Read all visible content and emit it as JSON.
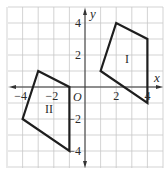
{
  "chart_data": {
    "type": "diagram",
    "title": "",
    "xlabel": "x",
    "ylabel": "y",
    "origin_label": "O",
    "xlim": [
      -5,
      5
    ],
    "ylim": [
      -5,
      5
    ],
    "grid": true,
    "x_ticks": [
      {
        "value": -4,
        "label": "−4"
      },
      {
        "value": -2,
        "label": "−2"
      },
      {
        "value": 2,
        "label": "2"
      },
      {
        "value": 4,
        "label": "4"
      }
    ],
    "y_ticks": [
      {
        "value": 4,
        "label": "4"
      },
      {
        "value": 2,
        "label": "2"
      },
      {
        "value": -2,
        "label": "−2"
      },
      {
        "value": -4,
        "label": "−4"
      }
    ],
    "shapes": [
      {
        "name": "I",
        "label": "I",
        "vertices": [
          [
            1,
            1
          ],
          [
            2,
            4
          ],
          [
            4,
            3
          ],
          [
            4,
            -1
          ]
        ],
        "label_pos": [
          2.7,
          1.5
        ]
      },
      {
        "name": "II",
        "label": "II",
        "vertices": [
          [
            -3,
            1
          ],
          [
            -1,
            0
          ],
          [
            -1,
            -4
          ],
          [
            -4,
            -2
          ]
        ],
        "label_pos": [
          -2.3,
          -1.6
        ]
      }
    ]
  },
  "colors": {
    "grid": "#c8c8c8",
    "axis": "#333333",
    "shape_stroke": "#1e1e1e",
    "background": "#ffffff"
  }
}
